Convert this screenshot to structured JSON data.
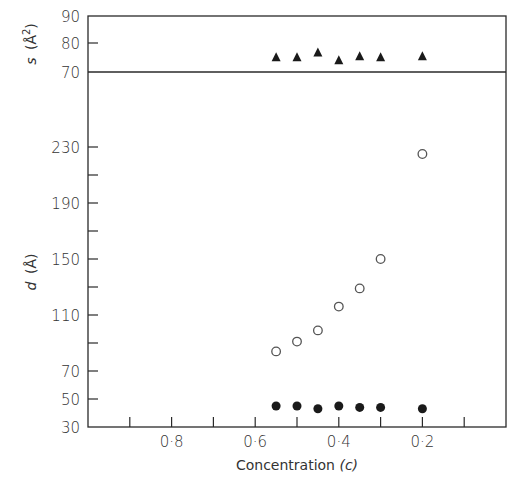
{
  "chart_data": [
    {
      "panel": "top",
      "type": "scatter",
      "title": "",
      "xlabel": "Concentration (c)",
      "ylabel": "s (Å²)",
      "ylim": [
        70,
        90
      ],
      "yticks_labeled": [
        70,
        80,
        90
      ],
      "xlim": [
        1.0,
        0.0
      ],
      "grid": false,
      "series": [
        {
          "name": "s",
          "marker": "filled-triangle",
          "x": [
            0.55,
            0.5,
            0.45,
            0.4,
            0.35,
            0.3,
            0.2
          ],
          "y": [
            75.3,
            75.3,
            77.0,
            74.2,
            75.6,
            75.3,
            75.6
          ]
        }
      ]
    },
    {
      "panel": "bottom",
      "type": "scatter",
      "title": "",
      "xlabel": "Concentration (c)",
      "ylabel": "d (Å)",
      "ylim": [
        30,
        250
      ],
      "yticks_labeled": [
        30,
        50,
        70,
        110,
        150,
        190,
        230
      ],
      "yticks_minor": [
        90,
        130,
        170,
        210
      ],
      "xlim": [
        1.0,
        0.0
      ],
      "xticks": [
        0.9,
        0.8,
        0.7,
        0.6,
        0.5,
        0.4,
        0.3,
        0.2,
        0.1
      ],
      "xticks_labeled": [
        "0·8",
        "0·6",
        "0·4",
        "0·2"
      ],
      "grid": false,
      "series": [
        {
          "name": "d (open circles)",
          "marker": "open-circle",
          "x": [
            0.55,
            0.5,
            0.45,
            0.4,
            0.35,
            0.3,
            0.2
          ],
          "y": [
            84,
            91,
            99,
            116,
            129,
            150,
            225
          ]
        },
        {
          "name": "d (filled circles)",
          "marker": "filled-circle",
          "x": [
            0.55,
            0.5,
            0.45,
            0.4,
            0.35,
            0.3,
            0.2
          ],
          "y": [
            45,
            45,
            43,
            45,
            44,
            44,
            43
          ]
        }
      ]
    }
  ],
  "labels": {
    "top_ylabel_main": "s",
    "top_ylabel_unit": "(Å",
    "top_ylabel_sup": "2",
    "top_ylabel_close": ")",
    "bottom_ylabel_main": "d",
    "bottom_ylabel_unit": "(Å)",
    "xlabel_main": "Concentration ",
    "xlabel_var": "(c)",
    "top_ticks": [
      "90",
      "80",
      "70"
    ],
    "bottom_ticks": [
      "230",
      "190",
      "150",
      "110",
      "70",
      "50",
      "30"
    ],
    "x_ticks": [
      "0·8",
      "0·6",
      "0·4",
      "0·2"
    ]
  }
}
